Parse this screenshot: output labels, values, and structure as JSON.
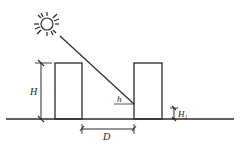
{
  "diagram": {
    "labels": {
      "building_height": "H",
      "spacing": "D",
      "sun_altitude": "h",
      "sill_height": "H",
      "sill_height_sub": "1"
    },
    "colors": {
      "stroke": "#2a2a2a",
      "background": "#ffffff"
    }
  }
}
